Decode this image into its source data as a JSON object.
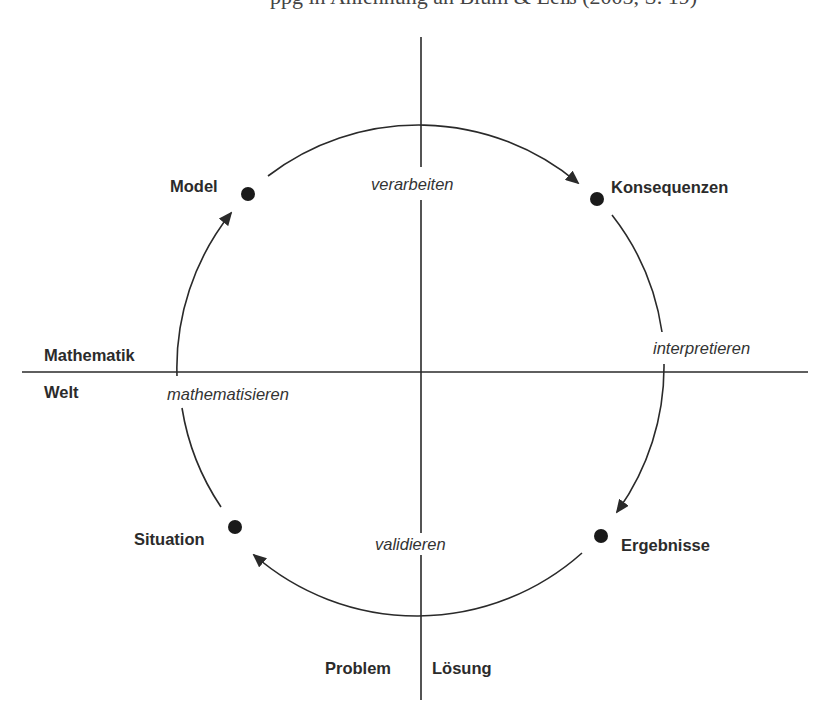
{
  "diagram": {
    "title_cutoff": "ppg in Anlehnung an Blum & Leiß (2005, S. 19)",
    "axes": {
      "horizontal": {
        "above": "Mathematik",
        "below": "Welt"
      },
      "vertical": {
        "left": "Problem",
        "right": "Lösung"
      }
    },
    "nodes": [
      {
        "id": "model",
        "label": "Model"
      },
      {
        "id": "konsequenzen",
        "label": "Konsequenzen"
      },
      {
        "id": "ergebnisse",
        "label": "Ergebnisse"
      },
      {
        "id": "situation",
        "label": "Situation"
      }
    ],
    "transitions": [
      {
        "from": "model",
        "to": "konsequenzen",
        "label": "verarbeiten"
      },
      {
        "from": "konsequenzen",
        "to": "ergebnisse",
        "label": "interpretieren"
      },
      {
        "from": "ergebnisse",
        "to": "situation",
        "label": "validieren"
      },
      {
        "from": "situation",
        "to": "model",
        "label": "mathematisieren"
      }
    ],
    "colors": {
      "line": "#2a2a2a",
      "dot": "#1a1a1a",
      "background": "#ffffff"
    }
  }
}
